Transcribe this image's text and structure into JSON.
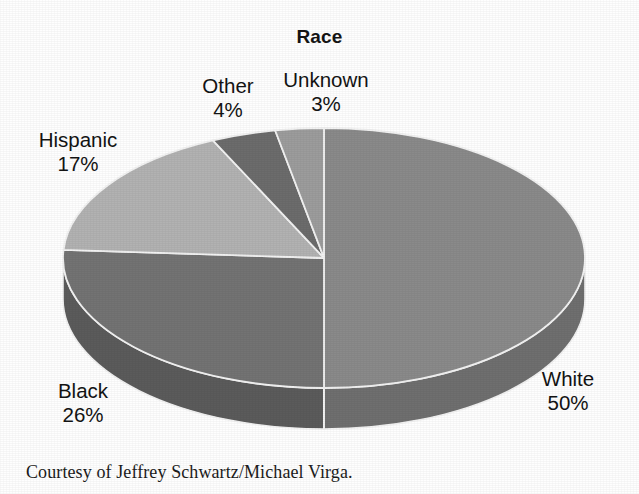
{
  "chart_data": {
    "type": "pie",
    "title": "Race",
    "xlabel": "",
    "ylabel": "",
    "legend_position": "none",
    "grid": false,
    "three_d": true,
    "start_angle_deg": 0,
    "direction": "clockwise",
    "categories": [
      "White",
      "Black",
      "Hispanic",
      "Other",
      "Unknown"
    ],
    "values": [
      50,
      26,
      17,
      4,
      3
    ],
    "unit": "%",
    "slices": [
      {
        "label": "White",
        "value": 50,
        "value_text": "50%",
        "top_color": "#8a8a8a",
        "side_color": "#6f6f6f"
      },
      {
        "label": "Black",
        "value": 26,
        "value_text": "26%",
        "top_color": "#737373",
        "side_color": "#5b5b5b"
      },
      {
        "label": "Hispanic",
        "value": 17,
        "value_text": "17%",
        "top_color": "#b2b2b2",
        "side_color": "#8f8f8f"
      },
      {
        "label": "Other",
        "value": 4,
        "value_text": "4%",
        "top_color": "#6c6c6c",
        "side_color": "#575757"
      },
      {
        "label": "Unknown",
        "value": 3,
        "value_text": "3%",
        "top_color": "#9c9c9c",
        "side_color": "#7d7d7d"
      }
    ],
    "annotations": [
      "Courtesy of Jeffrey Schwartz/Michael Virga."
    ]
  },
  "labels": {
    "other": {
      "name": "Other",
      "value": "4%"
    },
    "unknown": {
      "name": "Unknown",
      "value": "3%"
    },
    "hispanic": {
      "name": "Hispanic",
      "value": "17%"
    },
    "black": {
      "name": "Black",
      "value": "26%"
    },
    "white": {
      "name": "White",
      "value": "50%"
    }
  },
  "caption": {
    "text": "Courtesy of Jeffrey Schwartz/Michael Virga."
  },
  "colors": {
    "background": "#fefefe",
    "text": "#131313",
    "slice_outline": "#f2f2f2"
  }
}
